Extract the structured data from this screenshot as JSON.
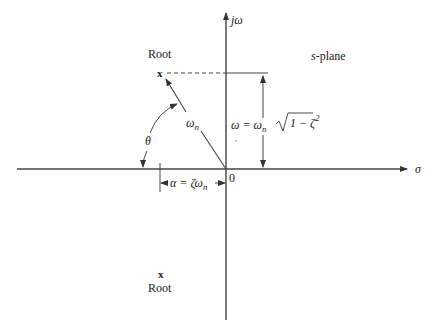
{
  "diagram": {
    "title": "s-plane",
    "colors": {
      "ink": "#333333",
      "background": "#ffffff"
    },
    "axes": {
      "vertical_label": "jω",
      "horizontal_label": "σ",
      "origin_label": "0"
    },
    "roots": [
      {
        "label": "Root",
        "marker": "x",
        "position": "upper-left"
      },
      {
        "label": "Root",
        "marker": "x",
        "position": "lower-left"
      }
    ],
    "vector": {
      "label_main": "ω",
      "label_sub": "n"
    },
    "angle": {
      "label": "θ"
    },
    "imag_dimension": {
      "lhs": "ω = ω",
      "lhs_sub": "n",
      "radicand": "1 − ζ",
      "radicand_exp": "2"
    },
    "real_dimension": {
      "text": "α = ζω",
      "sub": "n"
    }
  }
}
